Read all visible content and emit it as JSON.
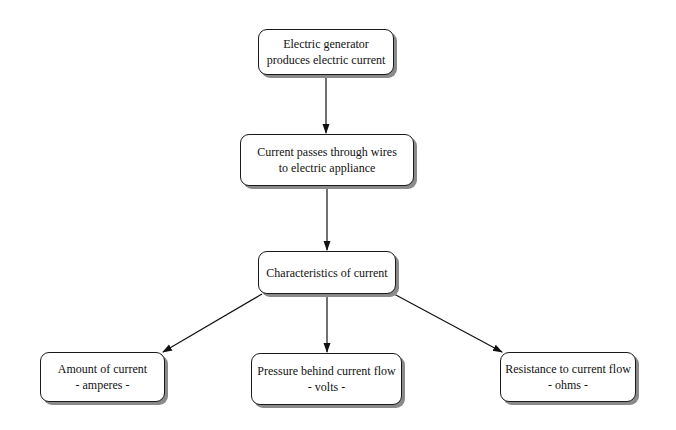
{
  "diagram": {
    "type": "flowchart",
    "nodes": [
      {
        "id": "generator",
        "lines": [
          "Electric generator",
          "produces electric current"
        ]
      },
      {
        "id": "wires",
        "lines": [
          "Current passes through wires",
          "to electric appliance"
        ]
      },
      {
        "id": "characteristics",
        "lines": [
          "Characteristics of current"
        ]
      },
      {
        "id": "amount",
        "lines": [
          "Amount of current",
          "- amperes -"
        ]
      },
      {
        "id": "pressure",
        "lines": [
          "Pressure behind current flow",
          "- volts -"
        ]
      },
      {
        "id": "resistance",
        "lines": [
          "Resistance to current flow",
          "- ohms -"
        ]
      }
    ],
    "edges": [
      {
        "from": "generator",
        "to": "wires"
      },
      {
        "from": "wires",
        "to": "characteristics"
      },
      {
        "from": "characteristics",
        "to": "amount"
      },
      {
        "from": "characteristics",
        "to": "pressure"
      },
      {
        "from": "characteristics",
        "to": "resistance"
      }
    ]
  }
}
